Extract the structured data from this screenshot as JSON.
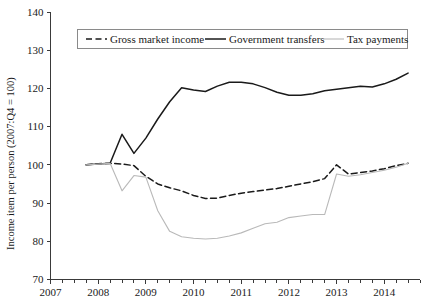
{
  "chart_data": {
    "type": "line",
    "title": "",
    "xlabel": "",
    "ylabel": "Income item per person (2007:Q4 = 100)",
    "xlim": [
      2007.0,
      2014.75
    ],
    "ylim": [
      70,
      140
    ],
    "yticks": [
      70,
      80,
      90,
      100,
      110,
      120,
      130,
      140
    ],
    "xticks": [
      2007,
      2008,
      2009,
      2010,
      2011,
      2012,
      2013,
      2014
    ],
    "xtick_labels": [
      "2007",
      "2008",
      "2009",
      "2010",
      "2011",
      "2012",
      "2013",
      "2014"
    ],
    "ytick_labels": [
      "70",
      "80",
      "90",
      "100",
      "110",
      "120",
      "130",
      "140"
    ],
    "x_minor_tick_interval": 0.25,
    "grid": false,
    "legend_position": "top-center",
    "x": [
      2007.75,
      2008.0,
      2008.25,
      2008.5,
      2008.75,
      2009.0,
      2009.25,
      2009.5,
      2009.75,
      2010.0,
      2010.25,
      2010.5,
      2010.75,
      2011.0,
      2011.25,
      2011.5,
      2011.75,
      2012.0,
      2012.25,
      2012.5,
      2012.75,
      2013.0,
      2013.25,
      2013.5,
      2013.75,
      2014.0,
      2014.25,
      2014.5
    ],
    "series": [
      {
        "name": "Gross market income",
        "style": "dashed",
        "color": "#1a1a1a",
        "values": [
          100.0,
          100.3,
          100.4,
          100.2,
          99.8,
          97.0,
          95.0,
          94.0,
          93.2,
          92.0,
          91.2,
          91.3,
          92.0,
          92.6,
          93.0,
          93.4,
          93.8,
          94.4,
          95.0,
          95.6,
          96.4,
          100.0,
          97.6,
          98.0,
          98.4,
          99.0,
          99.8,
          100.4
        ]
      },
      {
        "name": "Government transfers",
        "style": "solid",
        "color": "#1a1a1a",
        "values": [
          100.0,
          100.2,
          100.4,
          108.0,
          103.0,
          107.0,
          112.0,
          116.5,
          120.2,
          119.6,
          119.2,
          120.6,
          121.6,
          121.6,
          121.2,
          120.2,
          119.0,
          118.2,
          118.2,
          118.6,
          119.4,
          119.8,
          120.2,
          120.6,
          120.4,
          121.2,
          122.4,
          124.0
        ]
      },
      {
        "name": "Tax payments",
        "style": "solid-light",
        "color": "#b9b9b9",
        "values": [
          100.0,
          100.2,
          100.4,
          93.2,
          97.2,
          96.8,
          88.0,
          82.6,
          81.2,
          80.8,
          80.6,
          80.8,
          81.4,
          82.2,
          83.4,
          84.6,
          85.0,
          86.2,
          86.6,
          87.0,
          87.0,
          97.6,
          97.0,
          97.4,
          98.0,
          98.6,
          99.4,
          100.4
        ]
      }
    ],
    "legend": [
      {
        "label": "Gross market income",
        "style": "dashed",
        "color": "#1a1a1a"
      },
      {
        "label": "Government transfers",
        "style": "solid",
        "color": "#1a1a1a"
      },
      {
        "label": "Tax payments",
        "style": "solid-light",
        "color": "#b9b9b9"
      }
    ]
  }
}
